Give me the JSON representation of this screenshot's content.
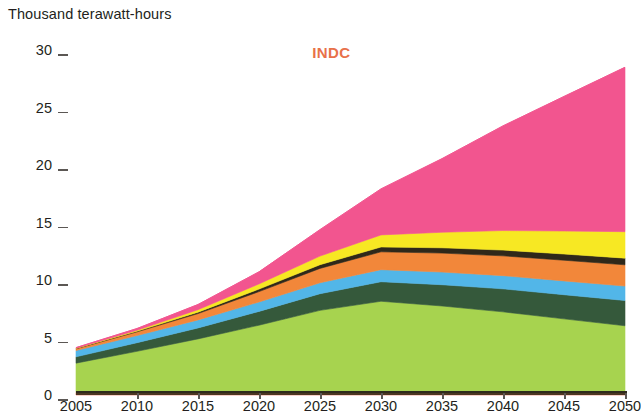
{
  "axis_title": "Thousand terawatt-hours",
  "scenario_title": "INDC",
  "colors": {
    "title_accent": "#e8714a",
    "axis": "#4b3621",
    "text": "#231f20"
  },
  "chart_data": {
    "type": "area",
    "title": "INDC",
    "subtitle": "",
    "xlabel": "",
    "ylabel": "Thousand terawatt-hours",
    "stacked": true,
    "grid": false,
    "legend": "none",
    "x": [
      2005,
      2010,
      2015,
      2020,
      2025,
      2030,
      2035,
      2040,
      2045,
      2050
    ],
    "xtick_labels": [
      "2005",
      "2010",
      "2015",
      "2020",
      "2025",
      "2030",
      "2035",
      "2040",
      "2045",
      "2050"
    ],
    "xlim": [
      2005,
      2050
    ],
    "ytick_labels": [
      "0",
      "5",
      "10",
      "15",
      "20",
      "25",
      "30"
    ],
    "yticks": [
      0,
      5,
      10,
      15,
      20,
      25,
      30
    ],
    "ylim": [
      0,
      30
    ],
    "series": [
      {
        "name": "oil",
        "color": "#e8664a",
        "values": [
          0.22,
          0.2,
          0.18,
          0.17,
          0.16,
          0.15,
          0.14,
          0.13,
          0.12,
          0.12
        ]
      },
      {
        "name": "coal",
        "color": "#a7d34f",
        "values": [
          2.55,
          3.6,
          4.7,
          5.9,
          7.2,
          8.0,
          7.6,
          7.1,
          6.5,
          5.9
        ]
      },
      {
        "name": "gas",
        "color": "#35593b",
        "values": [
          0.55,
          0.75,
          0.95,
          1.2,
          1.45,
          1.7,
          1.85,
          2.0,
          2.1,
          2.2
        ]
      },
      {
        "name": "nuclear",
        "color": "#52b6e8",
        "values": [
          0.55,
          0.62,
          0.7,
          0.82,
          0.95,
          1.05,
          1.1,
          1.15,
          1.2,
          1.25
        ]
      },
      {
        "name": "hydro",
        "color": "#f2873a",
        "values": [
          0.15,
          0.32,
          0.55,
          0.9,
          1.25,
          1.55,
          1.65,
          1.72,
          1.8,
          1.85
        ]
      },
      {
        "name": "biomass",
        "color": "#2f281a",
        "values": [
          0.03,
          0.06,
          0.12,
          0.22,
          0.32,
          0.42,
          0.46,
          0.5,
          0.54,
          0.58
        ]
      },
      {
        "name": "wind",
        "color": "#f7e823",
        "values": [
          0.02,
          0.08,
          0.22,
          0.45,
          0.75,
          1.05,
          1.35,
          1.7,
          2.0,
          2.3
        ]
      },
      {
        "name": "solar",
        "color": "#f2558f",
        "values": [
          0.05,
          0.15,
          0.45,
          1.05,
          2.3,
          4.0,
          6.4,
          9.1,
          11.7,
          14.3
        ]
      }
    ],
    "stack_totals": [
      4.12,
      5.78,
      7.87,
      10.71,
      14.38,
      17.92,
      20.55,
      23.4,
      25.96,
      28.5
    ],
    "annotations": []
  }
}
